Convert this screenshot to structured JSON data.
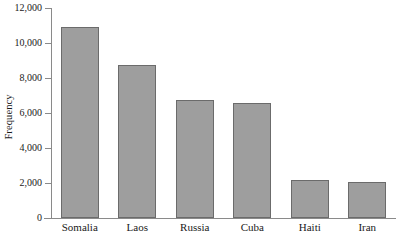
{
  "chart_data": {
    "type": "bar",
    "title": "",
    "xlabel": "",
    "ylabel": "Frequency",
    "categories": [
      "Somalia",
      "Laos",
      "Russia",
      "Cuba",
      "Haiti",
      "Iran"
    ],
    "values": [
      10900,
      8750,
      6750,
      6550,
      2150,
      2050
    ],
    "ylim": [
      0,
      12000
    ],
    "yticks": [
      0,
      2000,
      4000,
      6000,
      8000,
      10000,
      12000
    ],
    "ytick_labels": [
      "0",
      "2,000",
      "4,000",
      "6,000",
      "8,000",
      "10,000",
      "12,000"
    ],
    "grid": false,
    "legend": null,
    "bar_color": "#9e9e9e",
    "bar_edge_color": "#6b6b6b",
    "axis_color": "#8a8a8a",
    "background_color": "#ffffff"
  }
}
